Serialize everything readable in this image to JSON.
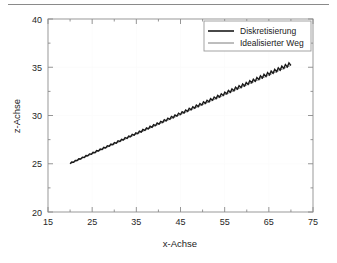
{
  "figure": {
    "separator_rule": true
  },
  "chart_data": {
    "type": "line",
    "title": "",
    "xlabel": "x-Achse",
    "ylabel": "z-Achse",
    "xlim": [
      15,
      75
    ],
    "ylim": [
      20,
      40
    ],
    "xticks": [
      15,
      25,
      35,
      45,
      55,
      65,
      75
    ],
    "xtick_labels": [
      "15",
      "25",
      "35",
      "45",
      "55",
      "65",
      "75"
    ],
    "yticks": [
      20,
      25,
      30,
      35,
      40
    ],
    "ytick_labels": [
      "20",
      "25",
      "30",
      "35",
      "40"
    ],
    "x_minor_ticks": [
      20,
      30,
      40,
      50,
      60,
      70
    ],
    "y_minor_ticks": [
      22.5,
      27.5,
      32.5,
      37.5
    ],
    "grid": false,
    "legend_position": "top-right-inside",
    "series": [
      {
        "name": "Diskretisierung",
        "color": "#1a1a1a",
        "width": 1.5,
        "style": "sawtooth-staircase",
        "description": "Treppenfoermige Diskretisierung entlang des idealisierten Weges",
        "x_start": 20.0,
        "x_end": 70.0,
        "y_start": 25.0,
        "y_end": 35.2,
        "tooth_count": 62,
        "amplitude_start": 0.18,
        "amplitude_end": 0.42
      },
      {
        "name": "Idealisierter Weg",
        "color": "#6e6e6e",
        "width": 0.8,
        "style": "straight-line",
        "x": [
          20.0,
          70.0
        ],
        "values": [
          25.0,
          35.2
        ]
      }
    ]
  },
  "legend": {
    "entries": [
      {
        "label": "Diskretisierung"
      },
      {
        "label": "Idealisierter Weg"
      }
    ]
  }
}
